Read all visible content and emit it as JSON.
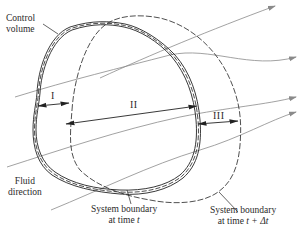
{
  "diagram": {
    "type": "control volume and system boundary (Reynolds transport theorem)",
    "labels": {
      "control_volume_line1": "Control",
      "control_volume_line2": "volume",
      "fluid_direction_line1": "Fluid",
      "fluid_direction_line2": "direction",
      "system_t_line1": "System boundary",
      "system_t_line2_prefix": "at time ",
      "system_t_line2_var": "t",
      "system_tdt_line1": "System boundary",
      "system_tdt_line2_prefix": "at time ",
      "system_tdt_line2_var": "t + Δt"
    },
    "regions": {
      "region_1": "I",
      "region_2": "II",
      "region_3": "III"
    },
    "colors": {
      "boundary": "#2a2a2a",
      "streamline": "#8a8a8a",
      "text": "#2a2a2a"
    }
  }
}
